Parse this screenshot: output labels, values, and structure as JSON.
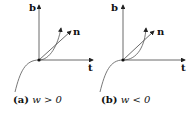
{
  "panels": [
    {
      "id": "a",
      "caption_tag": "(a)",
      "caption_math": "w > 0",
      "labels": {
        "b": "b",
        "n": "n",
        "t": "t"
      }
    },
    {
      "id": "b",
      "caption_tag": "(b)",
      "caption_math": "w < 0",
      "labels": {
        "b": "b",
        "n": "n",
        "t": "t"
      }
    }
  ],
  "colors": {
    "axis": "#444444",
    "curve": "#555555",
    "text": "#111111"
  }
}
